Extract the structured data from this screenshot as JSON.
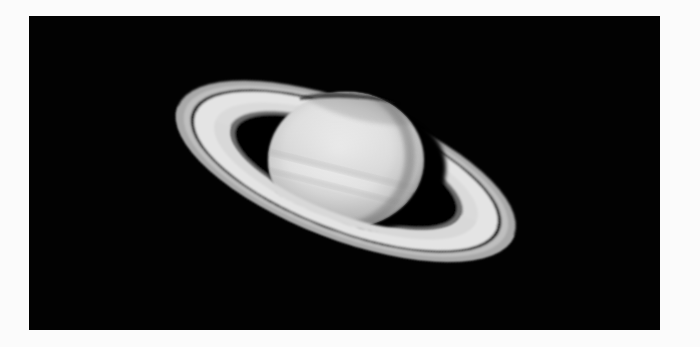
{
  "image": {
    "subject": "Saturn with rings",
    "description": "Grayscale telescope photograph of the planet Saturn with its ring system tilted toward the viewer, on a black sky background framed by a white border",
    "colors": {
      "border": "#fbfbfb",
      "sky": "#020202",
      "ring_bright": "#e6e6e6",
      "ring_outer": "#a8a8a8",
      "ring_gap": "#1a1a1a",
      "planet_light": "#ececec",
      "planet_shade": "#9a9a9a",
      "shadow": "#050505"
    }
  }
}
